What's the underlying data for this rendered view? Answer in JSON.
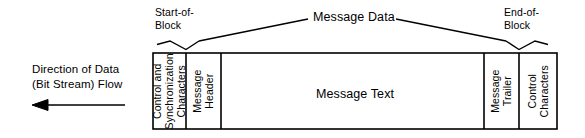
{
  "diagram": {
    "title_message_data": "Message Data",
    "callouts": {
      "start_of_block": "Start-of-\nBlock",
      "end_of_block": "End-of-\nBlock"
    },
    "flow": {
      "label": "Direction of Data\n(Bit Stream) Flow",
      "arrow_direction": "left",
      "arrow_icon": "left-arrow-icon"
    },
    "frame_cells": [
      {
        "id": "control-and-synchronization-characters",
        "label": "Control and\nSynchronization\nCharacters",
        "orientation": "vertical"
      },
      {
        "id": "message-header",
        "label": "Message\nHeader",
        "orientation": "vertical"
      },
      {
        "id": "message-text",
        "label": "Message Text",
        "orientation": "horizontal"
      },
      {
        "id": "message-trailer",
        "label": "Message\nTrailer",
        "orientation": "vertical"
      },
      {
        "id": "control-characters",
        "label": "Control\nCharacters",
        "orientation": "vertical"
      }
    ],
    "colors": {
      "stroke": "#000000",
      "background": "#ffffff",
      "text": "#000000"
    }
  }
}
